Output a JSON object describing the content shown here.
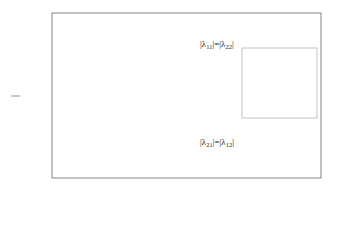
{
  "chart_data": {
    "type": "line",
    "title": "",
    "xlabel": "Frequency (rad/s)",
    "ylabel": "|λij|",
    "xscale": "log",
    "xlim": [
      0.0001,
      100
    ],
    "ylim": [
      -0.2,
      1.2
    ],
    "xticks": [
      "10^-4",
      "10^-2",
      "10^0",
      "10^2"
    ],
    "yticks": [
      "-0.2",
      "0",
      "0.2",
      "0.4",
      "0.6",
      "0.8",
      "1",
      "1.2"
    ],
    "grid": false,
    "legend_position": "right-center inside",
    "annotations": [
      "|λ11|=|λ22|",
      "|λ21|=|λ12|"
    ],
    "series": [
      {
        "name": "A(30%)",
        "style": "solid",
        "color": "#555555",
        "crossover_log10": -2.75
      },
      {
        "name": "B(40%)",
        "style": "dashed",
        "color": "#333333",
        "crossover_log10": -2.45
      },
      {
        "name": "C(65%)",
        "style": "solid",
        "color": "#777777",
        "crossover_log10": -2.6
      },
      {
        "name": "D(90%)",
        "style": "dashed-light",
        "color": "#bbbbbb",
        "crossover_log10": -2.3
      },
      {
        "name": "E(100%)",
        "style": "dashdot-light",
        "color": "#aaaaaa",
        "crossover_log10": -2.35
      }
    ]
  },
  "labels": {
    "xlabel": "Frequency (rad/s)",
    "ylabel": "|λ",
    "ylabel_sub": "ij",
    "ann_top": "|λ11|=|λ22|",
    "ann_bottom": "|λ21|=|λ12|"
  }
}
